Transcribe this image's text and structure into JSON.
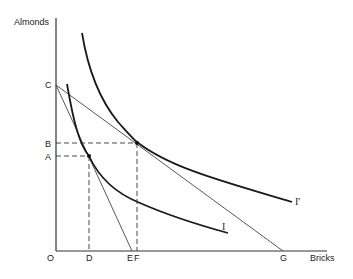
{
  "diagram": {
    "axes": {
      "y_label": "Almonds",
      "x_label": "Bricks",
      "origin_label": "O"
    },
    "y_points": [
      {
        "label": "C",
        "y": 85
      },
      {
        "label": "B",
        "y": 143
      },
      {
        "label": "A",
        "y": 156
      }
    ],
    "x_points": [
      {
        "label": "D",
        "x": 89
      },
      {
        "label": "E",
        "x": 131
      },
      {
        "label": "F",
        "x": 138
      },
      {
        "label": "G",
        "x": 283
      }
    ],
    "curves": [
      {
        "label": "I",
        "type": "indifference-curve"
      },
      {
        "label": "I'",
        "type": "indifference-curve"
      }
    ],
    "budget_lines": [
      {
        "from": "C",
        "to": "E"
      },
      {
        "from": "C",
        "to": "G"
      }
    ],
    "tangency_points": [
      {
        "name": "A-D",
        "on": "I"
      },
      {
        "name": "B-F",
        "on": "I'"
      }
    ],
    "colors": {
      "ink": "#222222",
      "background": "#ffffff"
    }
  }
}
